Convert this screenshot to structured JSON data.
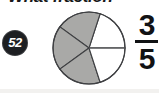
{
  "page": {
    "width": 159,
    "height": 93,
    "background_color": "#ffffff"
  },
  "heading": {
    "text": "What fraction",
    "clipped": "true"
  },
  "question_badge": {
    "number": "52",
    "fill_color": "#1d1f22",
    "text_color": "#ffffff"
  },
  "answer": {
    "numerator": "3",
    "denominator": "5"
  },
  "chart_data": {
    "type": "pie",
    "title": "",
    "total_slices": 5,
    "categories": [
      "Slice 1",
      "Slice 2",
      "Slice 3",
      "Slice 4",
      "Slice 5"
    ],
    "values": [
      1,
      1,
      1,
      1,
      1
    ],
    "slice_angle_degrees": 72,
    "shaded_count": 3,
    "unshaded_count": 2,
    "fraction_shaded": "3/5",
    "shaded_color": "#a9a9a7",
    "unshaded_color": "#ffffff",
    "outline_color": "#3f4043",
    "legend": "none",
    "grid": "off"
  },
  "colors": {
    "ink": "#111214",
    "pie_fill": "#a9a9a7",
    "pie_stroke": "#3f4043",
    "badge": "#1d1f22"
  }
}
